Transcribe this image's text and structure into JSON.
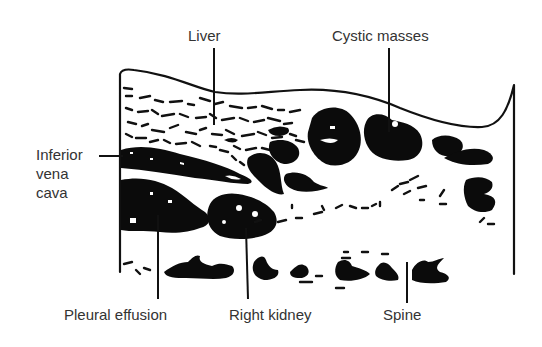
{
  "figure": {
    "type": "ultrasound line drawing",
    "background": "#ffffff",
    "ink": "#111111",
    "label_color": "#333333"
  },
  "labels": {
    "liver": "Liver",
    "cystic_masses": "Cystic masses",
    "ivc_line1": "Inferior",
    "ivc_line2": "vena",
    "ivc_line3": "cava",
    "pleural_effusion": "Pleural effusion",
    "right_kidney": "Right kidney",
    "spine": "Spine"
  }
}
